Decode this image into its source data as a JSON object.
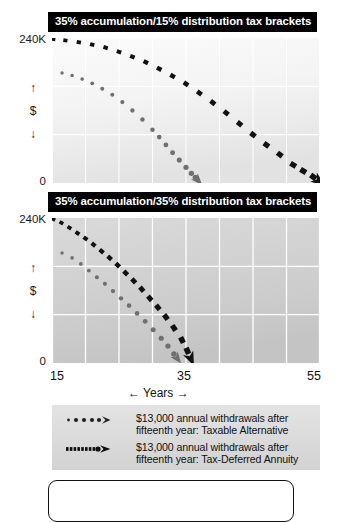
{
  "chart_data": [
    {
      "type": "line",
      "id": "panel-1",
      "title": "35% accumulation/15% distribution tax brackets",
      "xlabel": "← Years →",
      "ylabel": "↑ $ ↓",
      "xlim": [
        15,
        55
      ],
      "ylim": [
        0,
        240
      ],
      "ytick_labels": [
        "240K",
        "0"
      ],
      "xtick_labels": [
        "15",
        "35",
        "55"
      ],
      "grid": true,
      "x_gridlines": [
        15,
        20,
        25,
        30,
        35,
        40,
        45,
        50,
        55
      ],
      "y_gridlines": [
        80,
        160
      ],
      "series": [
        {
          "name": "$13,000 annual withdrawals after fifteenth year: Taxable Alternative",
          "style": "dotted-round",
          "color": "#6f6f6f",
          "x": [
            16.5,
            18,
            19.5,
            21,
            22.5,
            24,
            25.5,
            27,
            28.5,
            30,
            31,
            32,
            33,
            34,
            35,
            35.8,
            36.4,
            36.9
          ],
          "y": [
            182,
            178,
            172,
            165,
            156,
            146,
            134,
            120,
            105,
            88,
            76,
            63,
            50,
            38,
            26,
            16,
            9,
            3
          ]
        },
        {
          "name": "$13,000 annual withdrawals after fifteenth year: Tax-Deferred Annuity",
          "style": "dashed-square",
          "color": "#111111",
          "x": [
            15.2,
            17,
            19,
            21,
            23,
            25,
            27,
            29,
            31,
            33,
            35,
            37,
            39,
            41,
            43,
            45,
            47,
            49,
            51,
            52.5,
            54,
            55
          ],
          "y": [
            238,
            236,
            233,
            229,
            224,
            217,
            209,
            200,
            189,
            177,
            164,
            149,
            133,
            116,
            98,
            80,
            63,
            47,
            30,
            20,
            10,
            2
          ]
        }
      ]
    },
    {
      "type": "line",
      "id": "panel-2",
      "title": "35% accumulation/35% distribution tax brackets",
      "xlabel": "← Years →",
      "ylabel": "↑ $ ↓",
      "xlim": [
        15,
        55
      ],
      "ylim": [
        0,
        240
      ],
      "ytick_labels": [
        "240K",
        "0"
      ],
      "xtick_labels": [
        "15",
        "35",
        "55"
      ],
      "grid": true,
      "x_gridlines": [
        15,
        20,
        25,
        30,
        35,
        40,
        45,
        50,
        55
      ],
      "y_gridlines": [
        80,
        160
      ],
      "series": [
        {
          "name": "$13,000 annual withdrawals after fifteenth year: Taxable Alternative",
          "style": "dotted-round",
          "color": "#6f6f6f",
          "x": [
            16.5,
            18,
            19.3,
            20.5,
            21.7,
            22.9,
            24.1,
            25.3,
            26.5,
            27.7,
            28.9,
            30.1,
            31.3,
            32.3,
            33.2,
            33.8
          ],
          "y": [
            182,
            174,
            164,
            153,
            142,
            131,
            119,
            107,
            95,
            82,
            69,
            55,
            41,
            28,
            15,
            6
          ]
        },
        {
          "name": "$13,000 annual withdrawals after fifteenth year: Tax-Deferred Annuity",
          "style": "dashed-square",
          "color": "#111111",
          "x": [
            15.2,
            16.4,
            17.6,
            18.8,
            20.0,
            21.2,
            22.4,
            23.6,
            24.8,
            26.0,
            27.2,
            28.4,
            29.6,
            30.8,
            32.0,
            33.2,
            34.4,
            35.2,
            35.8
          ],
          "y": [
            238,
            232,
            224,
            215,
            206,
            196,
            185,
            174,
            162,
            149,
            136,
            122,
            107,
            92,
            76,
            58,
            38,
            20,
            5
          ]
        }
      ]
    }
  ],
  "panel1": {
    "title": "35% accumulation/15% distribution tax brackets",
    "y_top": "240K",
    "y_bottom": "0",
    "y_arrow_up": "↑",
    "y_currency": "$",
    "y_arrow_down": "↓"
  },
  "panel2": {
    "title": "35% accumulation/35% distribution tax brackets",
    "y_top": "240K",
    "y_bottom": "0",
    "y_arrow_up": "↑",
    "y_currency": "$",
    "y_arrow_down": "↓"
  },
  "xaxis": {
    "tick1": "15",
    "tick2": "35",
    "tick3": "55",
    "label": "←  Years  →"
  },
  "legend": {
    "items": [
      {
        "marker": "dotted-round-arrow",
        "line1": "$13,000 annual withdrawals after",
        "line2": "fifteenth year: Taxable Alternative"
      },
      {
        "marker": "dashed-square-arrow",
        "line1": "$13,000 annual withdrawals after",
        "line2": "fifteenth year: Tax-Deferred Annuity"
      }
    ]
  },
  "colors": {
    "title_bar_bg": "#000000",
    "title_bar_text": "#ffffff",
    "taxable_series": "#6f6f6f",
    "annuity_series": "#111111",
    "plot_bg_light": "#f7f7f7",
    "plot_bg_dark": "#c9c9c9",
    "gridline": "#ffffff",
    "legend_bg": "#dcdcdc"
  }
}
